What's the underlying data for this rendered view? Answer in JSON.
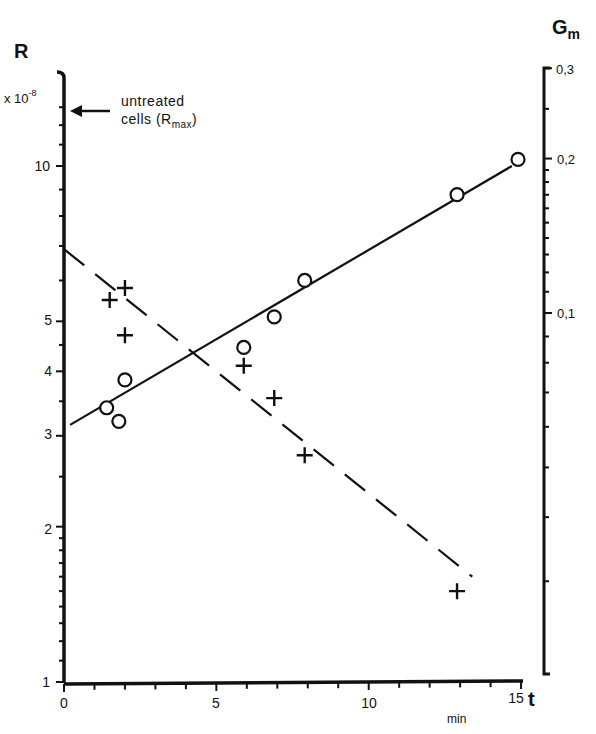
{
  "chart_data": {
    "type": "scatter",
    "title": "",
    "xlabel": "t",
    "xunit": "min",
    "ylabel": "R",
    "ylabel_multiplier": "x 10^-8",
    "y2label": "Gm",
    "xlim": [
      0,
      15
    ],
    "ylim": [
      1,
      13.5
    ],
    "y2lim": [
      0.02,
      0.3
    ],
    "yscale": "log",
    "y2scale": "log",
    "grid": false,
    "legend": "none",
    "x_ticks": [
      0,
      5,
      10,
      15
    ],
    "y_ticks": [
      1,
      2,
      3,
      4,
      5,
      10
    ],
    "y2_ticks": [
      "0,1",
      "0,2",
      "0,3"
    ],
    "annotation": {
      "text_line1": "untreated",
      "text_line2": "cells (R",
      "subscript": "max",
      "close": ")",
      "arrow_target_R": 12.8
    },
    "series": [
      {
        "name": "R (circles)",
        "marker": "circle",
        "points": [
          [
            1.4,
            3.4
          ],
          [
            1.8,
            3.2
          ],
          [
            2.0,
            3.85
          ],
          [
            5.9,
            4.45
          ],
          [
            6.9,
            5.1
          ],
          [
            7.9,
            6.0
          ],
          [
            12.9,
            8.8
          ],
          [
            14.9,
            10.3
          ]
        ],
        "fit_line": {
          "style": "solid",
          "from": [
            0.2,
            3.15
          ],
          "to": [
            14.7,
            10.0
          ]
        }
      },
      {
        "name": "Gm (crosses)",
        "marker": "cross",
        "points": [
          [
            1.5,
            5.5
          ],
          [
            2.0,
            5.8
          ],
          [
            2.0,
            4.7
          ],
          [
            5.9,
            4.1
          ],
          [
            6.9,
            3.55
          ],
          [
            7.9,
            2.75
          ],
          [
            12.9,
            1.5
          ]
        ],
        "fit_line": {
          "style": "dashed",
          "from": [
            0.0,
            6.9
          ],
          "to": [
            13.4,
            1.6
          ]
        }
      }
    ]
  },
  "labels": {
    "y_axis": "R",
    "y_mult": "x 10",
    "y_mult_exp": "-8",
    "y2_axis": "G",
    "y2_axis_sub": "m",
    "x_axis": "t",
    "x_unit": "min",
    "x_ticks": [
      "0",
      "5",
      "10",
      "15"
    ],
    "y_ticks": [
      "10",
      "5",
      "4",
      "3",
      "2",
      "1"
    ],
    "y2_ticks": [
      "0,3",
      "0,2",
      "0,1"
    ]
  }
}
